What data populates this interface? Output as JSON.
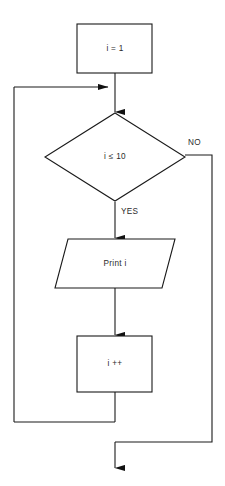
{
  "diagram": {
    "type": "flowchart",
    "nodes": [
      {
        "id": "init",
        "shape": "process-rectangle",
        "label": "i = 1",
        "name": "process-node-init"
      },
      {
        "id": "condition",
        "shape": "decision-diamond",
        "label": "i ≤ 10",
        "name": "decision-node-condition"
      },
      {
        "id": "output",
        "shape": "io-parallelogram",
        "label": "Print i",
        "name": "io-node-print"
      },
      {
        "id": "increment",
        "shape": "process-rectangle",
        "label": "i ++",
        "name": "process-node-increment"
      }
    ],
    "edge_labels": {
      "no": "NO",
      "yes": "YES"
    },
    "colors": {
      "stroke": "#1a1a1a",
      "fill": "#ffffff",
      "text": "#2b2b2b",
      "arrow": "#111111"
    }
  }
}
